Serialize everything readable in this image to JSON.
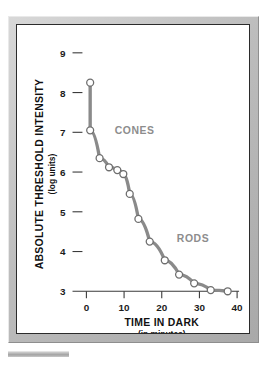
{
  "figure": {
    "background_color": "#ffffff",
    "frame_color": "#bdbdbd",
    "panel_border_color": "#2b2b2b"
  },
  "chart_data": {
    "type": "line",
    "title": "",
    "xlabel": "TIME IN DARK",
    "xlabel_sub": "(in minutes)",
    "ylabel": "ABSOLUTE THRESHOLD INTENSITY",
    "ylabel_sub": "(log units)",
    "xlim": [
      -3,
      43
    ],
    "ylim": [
      2.7,
      9.3
    ],
    "xticks": [
      0,
      10,
      20,
      30,
      40
    ],
    "xtick_labels": [
      "0",
      "10",
      "20",
      "30",
      "40"
    ],
    "yticks": [
      3,
      4,
      5,
      6,
      7,
      8,
      9
    ],
    "ytick_labels": [
      "3",
      "4",
      "5",
      "6",
      "7",
      "8",
      "9"
    ],
    "grid": false,
    "legend_position": "inline-annotations",
    "line_color": "#8a8a8a",
    "marker_face_color": "#ffffff",
    "marker_edge_color": "#6e6e6e",
    "series": [
      {
        "name": "Dark adaptation curve",
        "x": [
          1.0,
          1.0,
          3.5,
          6.0,
          8.2,
          9.8,
          11.5,
          13.8,
          16.8,
          20.8,
          24.6,
          28.6,
          33.0,
          37.5
        ],
        "y": [
          8.25,
          7.05,
          6.35,
          6.12,
          6.05,
          5.95,
          5.45,
          4.82,
          4.25,
          3.78,
          3.42,
          3.2,
          3.03,
          3.0
        ]
      }
    ],
    "annotations": [
      {
        "text": "CONES",
        "x": 7.5,
        "y": 7.05,
        "color": "#8d8d8d"
      },
      {
        "text": "RODS",
        "x": 24.0,
        "y": 4.35,
        "color": "#8d8d8d"
      }
    ]
  }
}
